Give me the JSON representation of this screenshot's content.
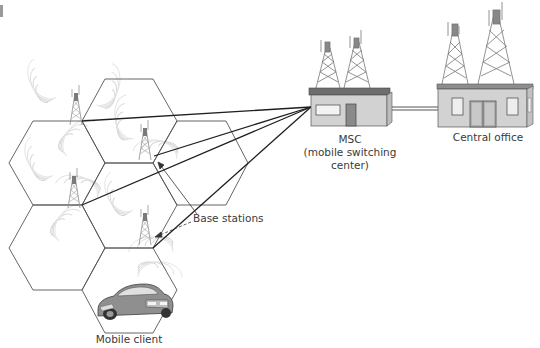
{
  "diagram": {
    "colors": {
      "hex_stroke": "#555555",
      "link_line": "#1f1f1f",
      "building_wall": "#d2d2d2",
      "building_roof": "#6e6e6e",
      "tower": "#8a8a8a",
      "signal": "#c8c8c8"
    },
    "labels": {
      "msc_line1": "MSC",
      "msc_line2": "(mobile switching",
      "msc_line3": "center)",
      "central_office": "Central office",
      "base_stations": "Base stations",
      "mobile_client": "Mobile client"
    },
    "nodes": [
      {
        "id": "msc",
        "label": "MSC (mobile switching center)",
        "type": "building"
      },
      {
        "id": "central-office",
        "label": "Central office",
        "type": "building"
      },
      {
        "id": "base-stations",
        "label": "Base stations",
        "type": "tower-group",
        "count": 4
      },
      {
        "id": "mobile-client",
        "label": "Mobile client",
        "type": "car"
      }
    ],
    "edges": [
      {
        "from": "base-station-1",
        "to": "msc"
      },
      {
        "from": "base-station-2",
        "to": "msc"
      },
      {
        "from": "base-station-3",
        "to": "msc"
      },
      {
        "from": "base-station-4",
        "to": "msc"
      },
      {
        "from": "msc",
        "to": "central-office"
      }
    ],
    "cells": 6
  }
}
